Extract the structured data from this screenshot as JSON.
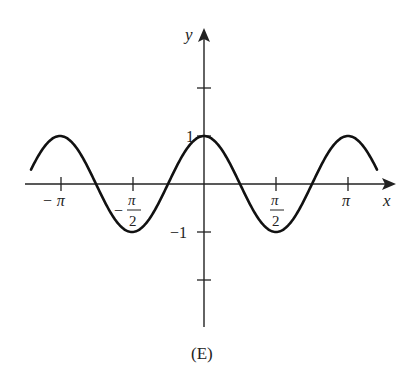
{
  "chart_data": {
    "type": "line",
    "title": "",
    "caption": "(E)",
    "xlabel": "x",
    "ylabel": "y",
    "function": "y = cos(2x)",
    "x_ticks": [
      "−π",
      "−π/2",
      "π/2",
      "π"
    ],
    "x_tick_values": [
      -3.14159,
      -1.5708,
      1.5708,
      3.14159
    ],
    "y_ticks": [
      "1",
      "−1"
    ],
    "y_tick_values": [
      2,
      1,
      -1,
      -2
    ],
    "xlim": [
      -3.5,
      3.5
    ],
    "ylim": [
      -3,
      3.3
    ],
    "grid": false,
    "series": [
      {
        "name": "cos(2x)",
        "x": [
          -3.14159,
          -2.3562,
          -1.5708,
          -0.7854,
          0,
          0.7854,
          1.5708,
          2.3562,
          3.14159
        ],
        "values": [
          1,
          0,
          -1,
          0,
          1,
          0,
          -1,
          0,
          1
        ]
      }
    ]
  },
  "labels": {
    "x_axis": "x",
    "y_axis": "y",
    "neg_pi": "− π",
    "neg_pi_over_2_sign": "−",
    "pi_num": "π",
    "two": "2",
    "pi": "π",
    "one": "1",
    "neg_one": "−1",
    "caption": "(E)"
  }
}
